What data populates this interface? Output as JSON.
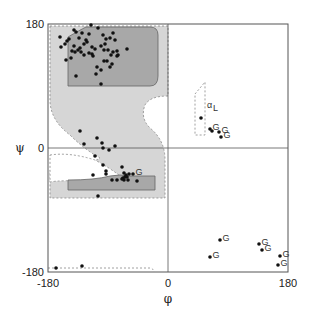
{
  "chart_data": {
    "type": "scatter",
    "title": "",
    "xlabel": "φ",
    "ylabel": "ψ",
    "xlim": [
      -180,
      180
    ],
    "ylim": [
      -180,
      180
    ],
    "x_ticks": [
      "-180",
      "0",
      "180"
    ],
    "y_ticks": [
      "180",
      "0",
      "-180"
    ],
    "grid": false,
    "zero_lines": true,
    "region_labels": [
      "α",
      "L"
    ],
    "annotations": [
      "G"
    ],
    "regions": [
      {
        "name": "allowed",
        "fill": "#d4d4d4",
        "style": "dashed"
      },
      {
        "name": "core-beta",
        "fill": "#a9a9a9"
      },
      {
        "name": "core-alpha",
        "fill": "#a9a9a9"
      },
      {
        "name": "alpha-L-allowed",
        "fill": "#ffffff",
        "style": "dashed"
      }
    ],
    "points_px": [
      [
        60,
        37
      ],
      [
        69,
        39
      ],
      [
        74,
        30
      ],
      [
        76,
        32
      ],
      [
        79,
        38
      ],
      [
        82,
        33
      ],
      [
        86,
        40
      ],
      [
        89,
        34
      ],
      [
        91,
        25
      ],
      [
        74,
        46
      ],
      [
        80,
        48
      ],
      [
        84,
        44
      ],
      [
        87,
        42
      ],
      [
        92,
        47
      ],
      [
        98,
        28
      ],
      [
        103,
        35
      ],
      [
        106,
        39
      ],
      [
        110,
        38
      ],
      [
        113,
        33
      ],
      [
        115,
        40
      ],
      [
        61,
        47
      ],
      [
        65,
        44
      ],
      [
        67,
        41
      ],
      [
        71,
        58
      ],
      [
        72,
        51
      ],
      [
        75,
        52
      ],
      [
        78,
        50
      ],
      [
        81,
        52
      ],
      [
        84,
        55
      ],
      [
        89,
        53
      ],
      [
        92,
        54
      ],
      [
        93,
        56
      ],
      [
        95,
        49
      ],
      [
        101,
        46
      ],
      [
        104,
        50
      ],
      [
        105,
        44
      ],
      [
        108,
        50
      ],
      [
        111,
        55
      ],
      [
        113,
        52
      ],
      [
        117,
        56
      ],
      [
        118,
        55
      ],
      [
        117,
        51
      ],
      [
        97,
        67
      ],
      [
        101,
        70
      ],
      [
        104,
        61
      ],
      [
        107,
        61
      ],
      [
        110,
        67
      ],
      [
        112,
        64
      ],
      [
        66,
        60
      ],
      [
        76,
        76
      ],
      [
        96,
        74
      ],
      [
        101,
        84
      ],
      [
        127,
        49
      ],
      [
        80,
        131
      ],
      [
        84,
        144
      ],
      [
        97,
        138
      ],
      [
        102,
        143
      ],
      [
        103,
        148
      ],
      [
        109,
        150
      ],
      [
        115,
        146
      ],
      [
        95,
        156
      ],
      [
        103,
        165
      ],
      [
        106,
        171
      ],
      [
        106,
        174
      ],
      [
        93,
        175
      ],
      [
        122,
        167
      ],
      [
        112,
        180
      ],
      [
        117,
        180
      ],
      [
        123,
        178
      ],
      [
        124,
        173
      ],
      [
        125,
        177
      ],
      [
        126,
        175
      ],
      [
        127,
        177
      ],
      [
        128,
        180
      ],
      [
        124,
        180
      ],
      [
        122,
        179
      ],
      [
        129,
        174
      ],
      [
        133,
        174
      ],
      [
        137,
        181
      ],
      [
        98,
        196
      ],
      [
        56,
        268
      ],
      [
        82,
        266
      ],
      [
        201,
        118
      ],
      [
        210,
        129
      ],
      [
        212,
        131
      ],
      [
        219,
        132
      ],
      [
        221,
        137
      ],
      [
        220,
        240
      ],
      [
        210,
        257
      ],
      [
        259,
        244
      ],
      [
        262,
        250
      ],
      [
        280,
        256
      ],
      [
        278,
        265
      ]
    ],
    "glycine_points_px": [
      [
        210,
        129
      ],
      [
        219,
        132
      ],
      [
        221,
        137
      ],
      [
        220,
        240
      ],
      [
        210,
        257
      ],
      [
        259,
        244
      ],
      [
        262,
        250
      ],
      [
        280,
        256
      ],
      [
        278,
        265
      ],
      [
        133,
        174
      ]
    ]
  }
}
